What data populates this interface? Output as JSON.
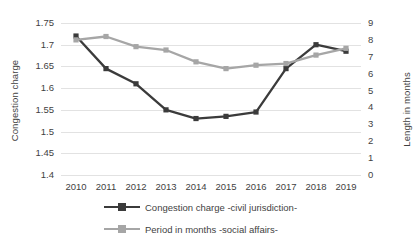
{
  "chart_data": {
    "type": "line",
    "title": "",
    "xlabel": "",
    "categories": [
      "2010",
      "2011",
      "2012",
      "2013",
      "2014",
      "2015",
      "2016",
      "2017",
      "2018",
      "2019"
    ],
    "grid": true,
    "legend_position": "bottom",
    "axes": {
      "left": {
        "label": "Congestion charge",
        "ticks": [
          "1.4",
          "1.45",
          "1.5",
          "1.55",
          "1.6",
          "1.65",
          "1.7",
          "1.75"
        ],
        "ylim": [
          1.4,
          1.75
        ],
        "step": 0.05
      },
      "right": {
        "label": "Length in months",
        "ticks": [
          "0",
          "1",
          "2",
          "3",
          "4",
          "5",
          "6",
          "7",
          "8",
          "9"
        ],
        "ylim": [
          0,
          9
        ],
        "step": 1
      }
    },
    "series": [
      {
        "name": "Congestion charge -civil jurisdiction-",
        "axis": "left",
        "color": "#3b3b3b",
        "marker": "square",
        "values": [
          1.72,
          1.645,
          1.61,
          1.55,
          1.53,
          1.535,
          1.545,
          1.645,
          1.7,
          1.685
        ]
      },
      {
        "name": "Period in months -social affairs-",
        "axis": "right",
        "color": "#a6a6a6",
        "marker": "square",
        "values": [
          8.0,
          8.2,
          7.6,
          7.4,
          6.7,
          6.3,
          6.5,
          6.6,
          7.1,
          7.5
        ]
      }
    ]
  }
}
